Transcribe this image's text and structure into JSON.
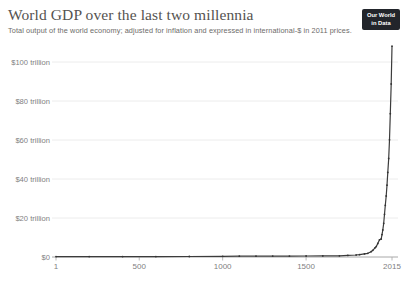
{
  "header": {
    "title": "World GDP over the last two millennia",
    "subtitle": "Total output of the world economy; adjusted for inflation and expressed in international-$ in 2011 prices."
  },
  "logo": {
    "line1": "Our World",
    "line2": "in Data"
  },
  "colors": {
    "line": "#3c3c3c",
    "point": "#333333",
    "grid": "#e7e7e7",
    "axis": "#a8a8a8",
    "tick_label": "#7f7f7f",
    "title": "#555350",
    "subtitle": "#6d6b69",
    "logo_bg": "#22252b",
    "logo_fg": "#ffffff"
  },
  "chart_data": {
    "type": "line",
    "title": "World GDP over the last two millennia",
    "subtitle": "Total output of the world economy; adjusted for inflation and expressed in international-$ in 2011 prices.",
    "xlabel": "Year",
    "ylabel": "World GDP (trillion international-$, 2011 prices)",
    "xlim": [
      1,
      2015
    ],
    "ylim_trillions": [
      0,
      105
    ],
    "grid": true,
    "legend": false,
    "x_ticks": [
      1,
      500,
      1000,
      1500,
      2015
    ],
    "x_tick_labels": [
      "1",
      "500",
      "1000",
      "1500",
      "2015"
    ],
    "y_ticks_trillions": [
      0,
      20,
      40,
      60,
      80,
      100
    ],
    "y_tick_labels": [
      "$0",
      "$20 trillion",
      "$40 trillion",
      "$60 trillion",
      "$80 trillion",
      "$100 trillion"
    ],
    "series": [
      {
        "name": "World GDP",
        "unit": "trillion international-$ (2011 prices)",
        "points": [
          [
            1,
            0.183
          ],
          [
            200,
            0.2
          ],
          [
            400,
            0.21
          ],
          [
            600,
            0.22
          ],
          [
            800,
            0.27
          ],
          [
            1000,
            0.35
          ],
          [
            1100,
            0.4
          ],
          [
            1200,
            0.43
          ],
          [
            1300,
            0.45
          ],
          [
            1400,
            0.44
          ],
          [
            1500,
            0.5
          ],
          [
            1600,
            0.58
          ],
          [
            1700,
            0.64
          ],
          [
            1750,
            0.82
          ],
          [
            1800,
            1.03
          ],
          [
            1820,
            1.2
          ],
          [
            1850,
            1.6
          ],
          [
            1870,
            1.92
          ],
          [
            1890,
            2.7
          ],
          [
            1900,
            3.42
          ],
          [
            1913,
            4.74
          ],
          [
            1920,
            5.32
          ],
          [
            1930,
            6.9
          ],
          [
            1940,
            8.8
          ],
          [
            1950,
            9.25
          ],
          [
            1955,
            11.5
          ],
          [
            1960,
            13.85
          ],
          [
            1965,
            17.3
          ],
          [
            1970,
            21.9
          ],
          [
            1975,
            26.5
          ],
          [
            1980,
            31.3
          ],
          [
            1985,
            36.8
          ],
          [
            1990,
            43.4
          ],
          [
            1995,
            50.5
          ],
          [
            2000,
            60.1
          ],
          [
            2005,
            73.5
          ],
          [
            2010,
            88.7
          ],
          [
            2015,
            108.1
          ]
        ]
      }
    ]
  }
}
